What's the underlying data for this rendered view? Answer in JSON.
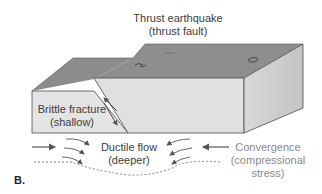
{
  "figure": {
    "panel_label": "B.",
    "title_line1": "Thrust earthquake",
    "title_line2": "(thrust fault)",
    "left_block_line1": "Brittle fracture",
    "left_block_line2": "(shallow)",
    "center_line1": "Ductile flow",
    "center_line2": "(deeper)",
    "right_line1": "Convergence",
    "right_line2": "(compressional",
    "right_line3": "stress)"
  },
  "colors": {
    "top_surface": "#8c8c8c",
    "front_face": "#e2e2e2",
    "side_face": "#cfcfcf",
    "outline": "#4a4a4a",
    "arrow": "#555555"
  }
}
